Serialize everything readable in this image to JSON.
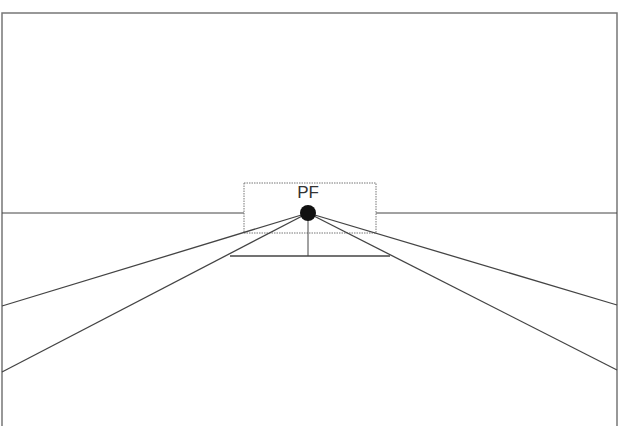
{
  "diagram": {
    "vanishing_point_label": "PF",
    "colors": {
      "line": "#444444",
      "frame": "#666666",
      "point": "#111111",
      "background": "#ffffff"
    }
  }
}
